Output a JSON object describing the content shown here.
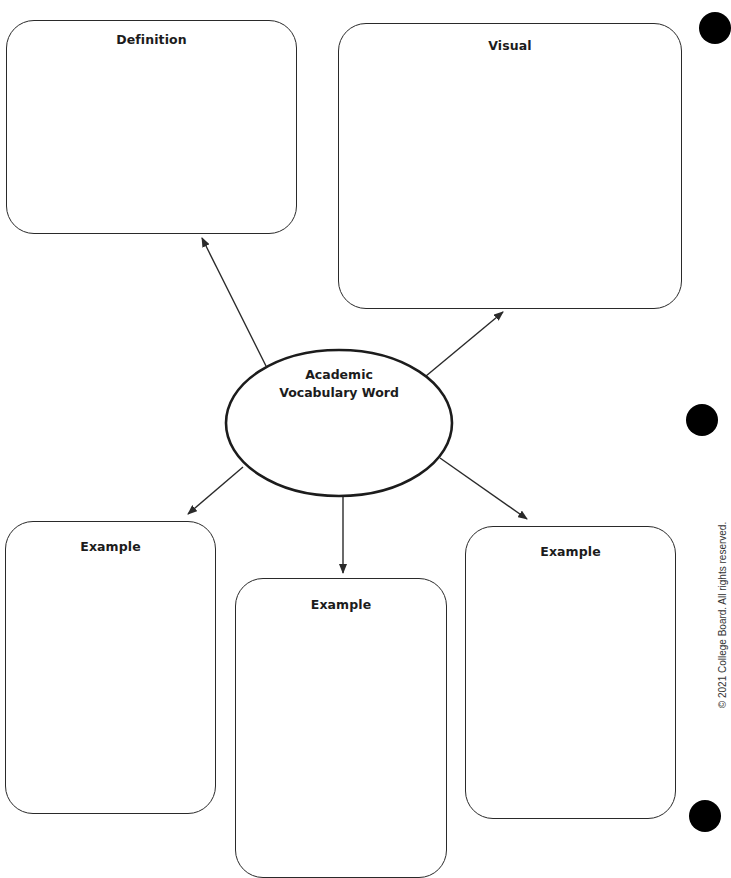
{
  "worksheet": {
    "title_fragment": "",
    "center": {
      "label_line1": "Academic",
      "label_line2": "Vocabulary Word"
    },
    "boxes": [
      {
        "id": "definition",
        "label": "Definition"
      },
      {
        "id": "visual",
        "label": "Visual"
      },
      {
        "id": "example-left",
        "label": "Example"
      },
      {
        "id": "example-middle",
        "label": "Example"
      },
      {
        "id": "example-right",
        "label": "Example"
      }
    ],
    "copyright": "© 2021 College Board. All rights reserved.",
    "colors": {
      "line": "#2a2a2a",
      "background": "#ffffff",
      "hole_punch": "#000000"
    }
  }
}
